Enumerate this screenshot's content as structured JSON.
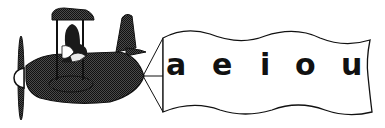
{
  "banner": {
    "letters": [
      "a",
      "e",
      "i",
      "o",
      "u"
    ]
  },
  "colors": {
    "plane_fill": "#2a2a2a",
    "outline": "#111111",
    "background": "#ffffff"
  }
}
